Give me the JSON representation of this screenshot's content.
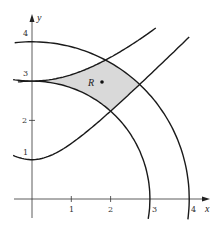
{
  "diagram": {
    "axes": {
      "x_label": "x",
      "y_label": "y",
      "x_ticks": [
        "1",
        "2",
        "3",
        "4"
      ],
      "y_ticks": [
        "1",
        "2",
        "3",
        "4"
      ]
    },
    "curves": [
      {
        "name": "circle-r3",
        "equation": "x^2+y^2=9"
      },
      {
        "name": "circle-r4",
        "equation": "x^2+y^2=16"
      },
      {
        "name": "hyperbola-1",
        "equation": "y^2-x^2=1"
      },
      {
        "name": "hyperbola-9",
        "equation": "y^2-x^2=9"
      }
    ],
    "region": {
      "label": "R",
      "fill": "#d9d9d9",
      "vertices": [
        [
          0,
          3
        ],
        [
          2,
          2.236
        ],
        [
          2.739,
          2.915
        ],
        [
          1.871,
          3.536
        ]
      ]
    },
    "colors": {
      "stroke": "#1a1a1a",
      "axis": "#333333"
    }
  }
}
